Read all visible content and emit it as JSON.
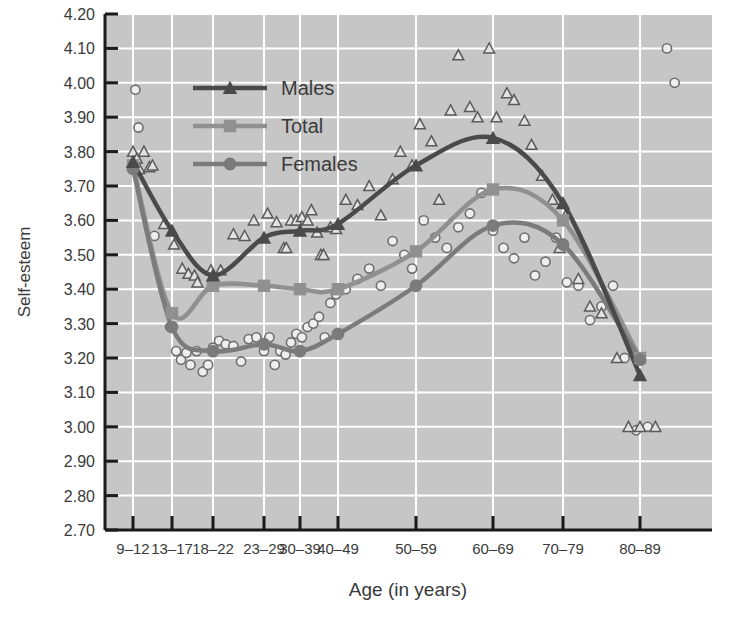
{
  "chart_data": {
    "type": "line",
    "title": "",
    "xlabel": "Age (in years)",
    "ylabel": "Self-esteem",
    "grid": true,
    "legend_position": "upper-left-inside",
    "categories": [
      "9–12",
      "13–17",
      "18–22",
      "23–29",
      "30–39",
      "40–49",
      "50–59",
      "60–69",
      "70–79",
      "80–89"
    ],
    "ylim": [
      2.7,
      4.2
    ],
    "yticks": [
      "2.70",
      "2.80",
      "2.90",
      "3.00",
      "3.10",
      "3.20",
      "3.30",
      "3.40",
      "3.50",
      "3.60",
      "3.70",
      "3.80",
      "3.90",
      "4.00",
      "4.10",
      "4.20"
    ],
    "series": [
      {
        "name": "Males",
        "marker": "triangle",
        "color": "#4a4a4a",
        "values": [
          3.77,
          3.57,
          3.44,
          3.55,
          3.57,
          3.59,
          3.76,
          3.84,
          3.65,
          3.15
        ]
      },
      {
        "name": "Total",
        "marker": "square",
        "color": "#909090",
        "values": [
          3.76,
          3.33,
          3.41,
          3.41,
          3.4,
          3.4,
          3.51,
          3.69,
          3.6,
          3.2
        ]
      },
      {
        "name": "Females",
        "marker": "circle",
        "color": "#7b7b7b",
        "values": [
          3.75,
          3.29,
          3.22,
          3.24,
          3.22,
          3.27,
          3.41,
          3.585,
          3.53,
          3.195
        ]
      }
    ],
    "scatter": {
      "males_triangles": [
        [
          0.0,
          3.8
        ],
        [
          0.1,
          3.78
        ],
        [
          0.28,
          3.8
        ],
        [
          0.16,
          3.75
        ],
        [
          0.42,
          3.755
        ],
        [
          0.5,
          3.76
        ],
        [
          0.8,
          3.59
        ],
        [
          1.05,
          3.53
        ],
        [
          1.25,
          3.46
        ],
        [
          1.4,
          3.445
        ],
        [
          1.55,
          3.44
        ],
        [
          1.62,
          3.42
        ],
        [
          1.95,
          3.455
        ],
        [
          2.15,
          3.455
        ],
        [
          2.4,
          3.56
        ],
        [
          2.62,
          3.555
        ],
        [
          2.8,
          3.6
        ],
        [
          3.1,
          3.62
        ],
        [
          3.35,
          3.595
        ],
        [
          3.55,
          3.52
        ],
        [
          3.62,
          3.52
        ],
        [
          3.75,
          3.6
        ],
        [
          3.9,
          3.6
        ],
        [
          4.05,
          3.61
        ],
        [
          4.2,
          3.6
        ],
        [
          4.3,
          3.63
        ],
        [
          4.45,
          3.565
        ],
        [
          4.55,
          3.5
        ],
        [
          4.62,
          3.5
        ],
        [
          4.8,
          3.58
        ],
        [
          4.95,
          3.575
        ],
        [
          5.1,
          3.66
        ],
        [
          5.25,
          3.645
        ],
        [
          5.4,
          3.7
        ],
        [
          5.55,
          3.615
        ],
        [
          5.7,
          3.72
        ],
        [
          5.8,
          3.8
        ],
        [
          5.95,
          3.76
        ],
        [
          6.05,
          3.88
        ],
        [
          6.2,
          3.83
        ],
        [
          6.3,
          3.66
        ],
        [
          6.45,
          3.92
        ],
        [
          6.55,
          4.08
        ],
        [
          6.7,
          3.93
        ],
        [
          6.8,
          3.9
        ],
        [
          6.95,
          4.1
        ],
        [
          7.05,
          3.9
        ],
        [
          7.2,
          3.97
        ],
        [
          7.3,
          3.95
        ],
        [
          7.45,
          3.89
        ],
        [
          7.55,
          3.82
        ],
        [
          7.7,
          3.73
        ],
        [
          7.85,
          3.66
        ],
        [
          7.95,
          3.52
        ],
        [
          8.05,
          3.62
        ],
        [
          8.2,
          3.43
        ],
        [
          8.35,
          3.35
        ],
        [
          8.5,
          3.33
        ],
        [
          8.7,
          3.2
        ],
        [
          8.85,
          3.0
        ],
        [
          9.0,
          3.0
        ],
        [
          9.2,
          3.0
        ],
        [
          9.4,
          4.21
        ]
      ],
      "females_circles": [
        [
          0.0,
          3.75
        ],
        [
          0.06,
          3.98
        ],
        [
          0.14,
          3.87
        ],
        [
          0.55,
          3.555
        ],
        [
          0.95,
          3.29
        ],
        [
          1.1,
          3.22
        ],
        [
          1.22,
          3.195
        ],
        [
          1.35,
          3.215
        ],
        [
          1.45,
          3.18
        ],
        [
          1.6,
          3.22
        ],
        [
          1.75,
          3.16
        ],
        [
          1.88,
          3.18
        ],
        [
          2.0,
          3.23
        ],
        [
          2.12,
          3.25
        ],
        [
          2.25,
          3.24
        ],
        [
          2.4,
          3.235
        ],
        [
          2.55,
          3.19
        ],
        [
          2.7,
          3.255
        ],
        [
          2.85,
          3.26
        ],
        [
          3.0,
          3.22
        ],
        [
          3.15,
          3.26
        ],
        [
          3.3,
          3.18
        ],
        [
          3.45,
          3.22
        ],
        [
          3.6,
          3.21
        ],
        [
          3.75,
          3.245
        ],
        [
          3.9,
          3.27
        ],
        [
          4.05,
          3.26
        ],
        [
          4.2,
          3.29
        ],
        [
          4.35,
          3.3
        ],
        [
          4.5,
          3.32
        ],
        [
          4.65,
          3.26
        ],
        [
          4.8,
          3.36
        ],
        [
          4.95,
          3.385
        ],
        [
          5.1,
          3.4
        ],
        [
          5.25,
          3.43
        ],
        [
          5.4,
          3.46
        ],
        [
          5.55,
          3.41
        ],
        [
          5.7,
          3.54
        ],
        [
          5.85,
          3.5
        ],
        [
          5.95,
          3.46
        ],
        [
          6.1,
          3.6
        ],
        [
          6.25,
          3.55
        ],
        [
          6.4,
          3.52
        ],
        [
          6.55,
          3.58
        ],
        [
          6.7,
          3.62
        ],
        [
          6.85,
          3.68
        ],
        [
          7.0,
          3.57
        ],
        [
          7.15,
          3.52
        ],
        [
          7.3,
          3.49
        ],
        [
          7.45,
          3.55
        ],
        [
          7.6,
          3.44
        ],
        [
          7.75,
          3.48
        ],
        [
          7.9,
          3.55
        ],
        [
          8.05,
          3.42
        ],
        [
          8.2,
          3.41
        ],
        [
          8.35,
          3.31
        ],
        [
          8.5,
          3.35
        ],
        [
          8.65,
          3.41
        ],
        [
          8.8,
          3.2
        ],
        [
          8.95,
          2.99
        ],
        [
          9.1,
          3.0
        ],
        [
          9.35,
          4.1
        ],
        [
          9.45,
          4.0
        ]
      ]
    }
  },
  "legend": {
    "items": [
      {
        "label": "Males"
      },
      {
        "label": "Total"
      },
      {
        "label": "Females"
      }
    ]
  },
  "axis": {
    "y_title": "Self-esteem",
    "x_title": "Age (in years)"
  },
  "colors": {
    "plot_background": "#c6c6c6",
    "grid": "#ffffff",
    "axis": "#1a1a1a",
    "males": "#4a4a4a",
    "total": "#909090",
    "females": "#7b7b7b",
    "text": "#3a3a3a"
  }
}
